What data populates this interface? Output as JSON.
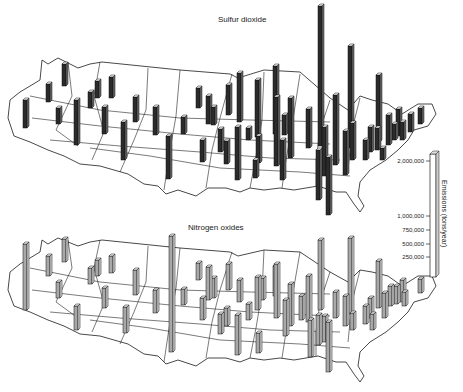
{
  "chart_data": [
    {
      "type": "bar",
      "variant": "3d-map-bars",
      "title": "Sulfur dioxide",
      "bar_color": "#2b2b2b",
      "bars": [
        {
          "x": 25,
          "base": 128,
          "h": 28
        },
        {
          "x": 48,
          "base": 102,
          "h": 18
        },
        {
          "x": 64,
          "base": 86,
          "h": 22
        },
        {
          "x": 58,
          "base": 124,
          "h": 16
        },
        {
          "x": 76,
          "base": 145,
          "h": 45
        },
        {
          "x": 90,
          "base": 108,
          "h": 16
        },
        {
          "x": 97,
          "base": 98,
          "h": 17
        },
        {
          "x": 104,
          "base": 134,
          "h": 27
        },
        {
          "x": 111,
          "base": 98,
          "h": 21
        },
        {
          "x": 123,
          "base": 160,
          "h": 38
        },
        {
          "x": 135,
          "base": 122,
          "h": 25
        },
        {
          "x": 155,
          "base": 135,
          "h": 28
        },
        {
          "x": 168,
          "base": 179,
          "h": 43
        },
        {
          "x": 183,
          "base": 134,
          "h": 17
        },
        {
          "x": 198,
          "base": 108,
          "h": 20
        },
        {
          "x": 202,
          "base": 162,
          "h": 22
        },
        {
          "x": 208,
          "base": 124,
          "h": 28
        },
        {
          "x": 213,
          "base": 125,
          "h": 18
        },
        {
          "x": 220,
          "base": 152,
          "h": 23
        },
        {
          "x": 226,
          "base": 164,
          "h": 23
        },
        {
          "x": 228,
          "base": 115,
          "h": 30
        },
        {
          "x": 237,
          "base": 180,
          "h": 53
        },
        {
          "x": 239,
          "base": 122,
          "h": 49
        },
        {
          "x": 248,
          "base": 140,
          "h": 12
        },
        {
          "x": 255,
          "base": 178,
          "h": 18
        },
        {
          "x": 257,
          "base": 137,
          "h": 57
        },
        {
          "x": 258,
          "base": 163,
          "h": 27
        },
        {
          "x": 275,
          "base": 134,
          "h": 68
        },
        {
          "x": 276,
          "base": 166,
          "h": 69
        },
        {
          "x": 282,
          "base": 180,
          "h": 40
        },
        {
          "x": 284,
          "base": 135,
          "h": 20
        },
        {
          "x": 290,
          "base": 158,
          "h": 60
        },
        {
          "x": 308,
          "base": 148,
          "h": 39
        },
        {
          "x": 318,
          "base": 200,
          "h": 50
        },
        {
          "x": 320,
          "base": 146,
          "h": 140
        },
        {
          "x": 324,
          "base": 176,
          "h": 49
        },
        {
          "x": 328,
          "base": 215,
          "h": 58
        },
        {
          "x": 335,
          "base": 165,
          "h": 70
        },
        {
          "x": 345,
          "base": 175,
          "h": 44
        },
        {
          "x": 350,
          "base": 148,
          "h": 102
        },
        {
          "x": 352,
          "base": 160,
          "h": 37
        },
        {
          "x": 365,
          "base": 160,
          "h": 20
        },
        {
          "x": 370,
          "base": 152,
          "h": 25
        },
        {
          "x": 377,
          "base": 150,
          "h": 22
        },
        {
          "x": 382,
          "base": 160,
          "h": 12
        },
        {
          "x": 378,
          "base": 142,
          "h": 67
        },
        {
          "x": 388,
          "base": 145,
          "h": 30
        },
        {
          "x": 394,
          "base": 140,
          "h": 16
        },
        {
          "x": 398,
          "base": 136,
          "h": 27
        },
        {
          "x": 402,
          "base": 140,
          "h": 18
        },
        {
          "x": 410,
          "base": 132,
          "h": 18
        },
        {
          "x": 420,
          "base": 124,
          "h": 16
        }
      ]
    },
    {
      "type": "bar",
      "variant": "3d-map-bars",
      "title": "Nitrogen oxides",
      "bar_color": "#a8a8a8",
      "bars": [
        {
          "x": 25,
          "base": 310,
          "h": 66
        },
        {
          "x": 48,
          "base": 276,
          "h": 20
        },
        {
          "x": 64,
          "base": 262,
          "h": 23
        },
        {
          "x": 58,
          "base": 298,
          "h": 16
        },
        {
          "x": 76,
          "base": 330,
          "h": 24
        },
        {
          "x": 90,
          "base": 284,
          "h": 16
        },
        {
          "x": 97,
          "base": 276,
          "h": 16
        },
        {
          "x": 104,
          "base": 308,
          "h": 20
        },
        {
          "x": 111,
          "base": 273,
          "h": 17
        },
        {
          "x": 125,
          "base": 333,
          "h": 26
        },
        {
          "x": 135,
          "base": 295,
          "h": 25
        },
        {
          "x": 155,
          "base": 313,
          "h": 23
        },
        {
          "x": 171,
          "base": 352,
          "h": 116
        },
        {
          "x": 183,
          "base": 305,
          "h": 16
        },
        {
          "x": 198,
          "base": 280,
          "h": 17
        },
        {
          "x": 202,
          "base": 320,
          "h": 22
        },
        {
          "x": 208,
          "base": 300,
          "h": 33
        },
        {
          "x": 213,
          "base": 298,
          "h": 20
        },
        {
          "x": 220,
          "base": 334,
          "h": 20
        },
        {
          "x": 226,
          "base": 326,
          "h": 18
        },
        {
          "x": 228,
          "base": 290,
          "h": 26
        },
        {
          "x": 237,
          "base": 355,
          "h": 40
        },
        {
          "x": 239,
          "base": 302,
          "h": 22
        },
        {
          "x": 248,
          "base": 320,
          "h": 16
        },
        {
          "x": 257,
          "base": 310,
          "h": 33
        },
        {
          "x": 258,
          "base": 353,
          "h": 20
        },
        {
          "x": 262,
          "base": 300,
          "h": 22
        },
        {
          "x": 275,
          "base": 296,
          "h": 30
        },
        {
          "x": 276,
          "base": 318,
          "h": 54
        },
        {
          "x": 285,
          "base": 336,
          "h": 36
        },
        {
          "x": 290,
          "base": 326,
          "h": 42
        },
        {
          "x": 301,
          "base": 320,
          "h": 24
        },
        {
          "x": 308,
          "base": 322,
          "h": 46
        },
        {
          "x": 310,
          "base": 357,
          "h": 37
        },
        {
          "x": 318,
          "base": 345,
          "h": 30
        },
        {
          "x": 320,
          "base": 310,
          "h": 70
        },
        {
          "x": 324,
          "base": 342,
          "h": 26
        },
        {
          "x": 328,
          "base": 372,
          "h": 50
        },
        {
          "x": 335,
          "base": 318,
          "h": 26
        },
        {
          "x": 345,
          "base": 326,
          "h": 30
        },
        {
          "x": 350,
          "base": 314,
          "h": 76
        },
        {
          "x": 352,
          "base": 330,
          "h": 17
        },
        {
          "x": 365,
          "base": 324,
          "h": 18
        },
        {
          "x": 370,
          "base": 318,
          "h": 20
        },
        {
          "x": 372,
          "base": 330,
          "h": 16
        },
        {
          "x": 378,
          "base": 308,
          "h": 47
        },
        {
          "x": 384,
          "base": 318,
          "h": 25
        },
        {
          "x": 390,
          "base": 306,
          "h": 20
        },
        {
          "x": 396,
          "base": 304,
          "h": 18
        },
        {
          "x": 402,
          "base": 302,
          "h": 22
        },
        {
          "x": 404,
          "base": 306,
          "h": 14
        },
        {
          "x": 420,
          "base": 293,
          "h": 14
        }
      ]
    }
  ],
  "scale": {
    "axis_label": "Emissions (tons/year)",
    "ticks": [
      {
        "label": "2,000,000",
        "y": 161
      },
      {
        "label": "1,000,000",
        "y": 216
      },
      {
        "label": "750,000",
        "y": 230
      },
      {
        "label": "500,000",
        "y": 244
      },
      {
        "label": "250,000",
        "y": 257
      }
    ]
  }
}
